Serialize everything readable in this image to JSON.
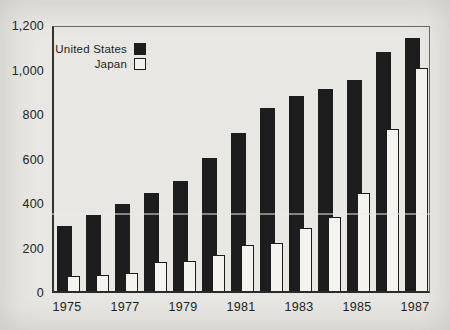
{
  "chart_data": {
    "type": "bar",
    "title": "",
    "xlabel": "",
    "ylabel": "",
    "categories": [
      "1975",
      "1976",
      "1977",
      "1978",
      "1979",
      "1980",
      "1981",
      "1982",
      "1983",
      "1984",
      "1985",
      "1986",
      "1987"
    ],
    "series": [
      {
        "name": "United States",
        "style": "filled",
        "color": "#1d1d1d",
        "values": [
          295,
          345,
          395,
          445,
          500,
          605,
          720,
          830,
          885,
          920,
          960,
          1085,
          1150
        ]
      },
      {
        "name": "Japan",
        "style": "outline",
        "color": "#f4f3ef",
        "outline_color": "#1c1c1c",
        "values": [
          70,
          75,
          80,
          130,
          135,
          165,
          210,
          220,
          285,
          335,
          445,
          735,
          1015
        ]
      }
    ],
    "ylim": [
      0,
      1200
    ],
    "yticks": [
      0,
      200,
      400,
      600,
      800,
      1000,
      1200
    ],
    "ytick_labels": [
      "0",
      "200",
      "400",
      "600",
      "800",
      "1,000",
      "1,200"
    ],
    "xticks_shown_every": 2,
    "xtick_labels": [
      "1975",
      "1977",
      "1979",
      "1981",
      "1983",
      "1985",
      "1987"
    ],
    "grid": false,
    "legend_position": "top-left"
  },
  "legend": {
    "items": [
      {
        "label": "United States",
        "swatch": "filled-black-square"
      },
      {
        "label": "Japan",
        "swatch": "open-white-square"
      }
    ]
  },
  "colors": {
    "background": "#e8e7e3",
    "bar_filled": "#1d1d1d",
    "bar_open_fill": "#f4f3ef",
    "bar_outline": "#1c1c1c",
    "axis": "#34342f",
    "text": "#232320"
  }
}
